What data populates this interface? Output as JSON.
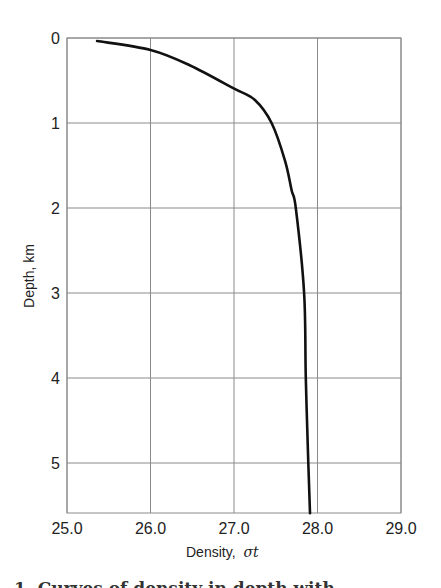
{
  "chart_data": {
    "type": "line",
    "title": "",
    "xlabel": "Density, σt",
    "ylabel": "Depth, km",
    "xlim": [
      25.0,
      29.0
    ],
    "ylim": [
      0,
      5.59
    ],
    "y_inverted": true,
    "grid": true,
    "legend": null,
    "x_ticks": [
      "25.0",
      "26.0",
      "27.0",
      "28.0",
      "29.0"
    ],
    "y_ticks": [
      "0",
      "1",
      "2",
      "3",
      "4",
      "5"
    ],
    "series": [
      {
        "name": "density-profile",
        "color": "#111111",
        "points": [
          {
            "density": 25.36,
            "depth": 0.035
          },
          {
            "density": 26.0,
            "depth": 0.14
          },
          {
            "density": 26.47,
            "depth": 0.32
          },
          {
            "density": 26.99,
            "depth": 0.59
          },
          {
            "density": 27.25,
            "depth": 0.73
          },
          {
            "density": 27.45,
            "depth": 1.0
          },
          {
            "density": 27.61,
            "depth": 1.44
          },
          {
            "density": 27.69,
            "depth": 1.79
          },
          {
            "density": 27.74,
            "depth": 2.0
          },
          {
            "density": 27.84,
            "depth": 3.0
          },
          {
            "density": 27.86,
            "depth": 4.0
          },
          {
            "density": 27.89,
            "depth": 5.0
          },
          {
            "density": 27.91,
            "depth": 5.59
          }
        ]
      }
    ]
  },
  "labels": {
    "xlabel_main": "Density,",
    "xlabel_symbol": "σt",
    "ylabel": "Depth, km"
  },
  "caption_fragment": "1.  Curves of density in depth with"
}
